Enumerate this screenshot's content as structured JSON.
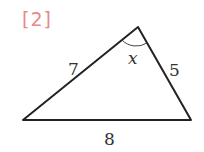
{
  "problem_label": "[2]",
  "triangle": {
    "sides": {
      "left": "7",
      "right": "5",
      "bottom": "8"
    },
    "angle_label": "x",
    "colors": {
      "stroke": "#222222",
      "label": "#e8888a"
    }
  }
}
